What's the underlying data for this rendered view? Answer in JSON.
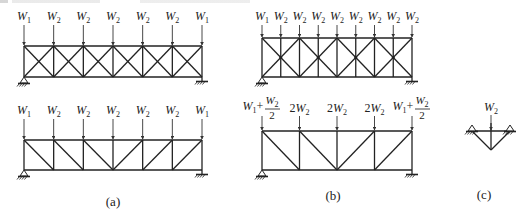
{
  "figure": {
    "panels": [
      {
        "id": "a",
        "caption": "(a)",
        "trusses": [
          {
            "name": "truss-a-cross-braced",
            "type": "x-braced",
            "panels": 6,
            "loads": [
              {
                "symbol": "W",
                "sub": "1"
              },
              {
                "symbol": "W",
                "sub": "2"
              },
              {
                "symbol": "W",
                "sub": "2"
              },
              {
                "symbol": "W",
                "sub": "2"
              },
              {
                "symbol": "W",
                "sub": "2"
              },
              {
                "symbol": "W",
                "sub": "2"
              },
              {
                "symbol": "W",
                "sub": "1"
              }
            ]
          },
          {
            "name": "truss-a-howe",
            "type": "single-diagonal",
            "panels": 6,
            "diagonals": [
              "down-right",
              "down-right",
              "down-right",
              "up-right",
              "up-right",
              "up-right"
            ],
            "loads": [
              {
                "symbol": "W",
                "sub": "1"
              },
              {
                "symbol": "W",
                "sub": "2"
              },
              {
                "symbol": "W",
                "sub": "2"
              },
              {
                "symbol": "W",
                "sub": "2"
              },
              {
                "symbol": "W",
                "sub": "2"
              },
              {
                "symbol": "W",
                "sub": "2"
              },
              {
                "symbol": "W",
                "sub": "1"
              }
            ]
          }
        ]
      },
      {
        "id": "b",
        "caption": "(b)",
        "trusses": [
          {
            "name": "truss-b-double-x",
            "type": "double-x-braced",
            "panels": 8,
            "loads": [
              {
                "symbol": "W",
                "sub": "1"
              },
              {
                "symbol": "W",
                "sub": "2"
              },
              {
                "symbol": "W",
                "sub": "2"
              },
              {
                "symbol": "W",
                "sub": "2"
              },
              {
                "symbol": "W",
                "sub": "2"
              },
              {
                "symbol": "W",
                "sub": "2"
              },
              {
                "symbol": "W",
                "sub": "2"
              },
              {
                "symbol": "W",
                "sub": "2"
              },
              {
                "symbol": "W",
                "sub": "2"
              }
            ]
          },
          {
            "name": "truss-b-equivalent",
            "type": "single-diagonal",
            "panels": 4,
            "diagonals": [
              "down-right",
              "down-right",
              "up-right",
              "up-right"
            ],
            "loads": [
              {
                "text": "W1 + W2/2",
                "prefix": "W",
                "prefix_sub": "1",
                "plus": "+",
                "num": "W",
                "num_sub": "2",
                "den": "2"
              },
              {
                "text": "2W2",
                "coef": "2",
                "symbol": "W",
                "sub": "2"
              },
              {
                "text": "2W2",
                "coef": "2",
                "symbol": "W",
                "sub": "2"
              },
              {
                "text": "2W2",
                "coef": "2",
                "symbol": "W",
                "sub": "2"
              },
              {
                "text": "W1 + W2/2",
                "prefix": "W",
                "prefix_sub": "1",
                "plus": "+",
                "num": "W",
                "num_sub": "2",
                "den": "2"
              }
            ]
          }
        ]
      },
      {
        "id": "c",
        "caption": "(c)",
        "element": {
          "name": "triangular-sub-truss",
          "load": {
            "symbol": "W",
            "sub": "2"
          }
        }
      }
    ]
  }
}
